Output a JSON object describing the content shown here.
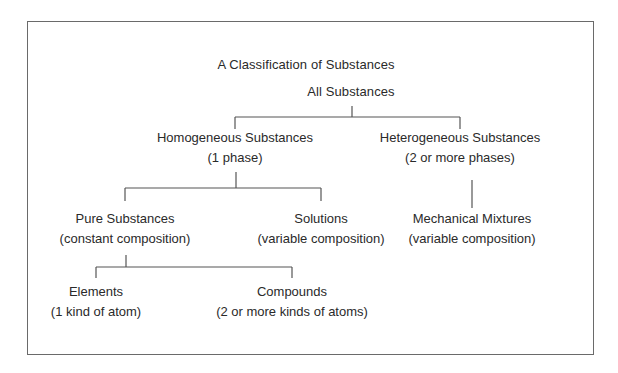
{
  "diagram": {
    "title": "A Classification of Substances",
    "root": {
      "name": "All Substances"
    },
    "nodes": {
      "homogeneous": {
        "name": "Homogeneous Substances",
        "note": "(1 phase)"
      },
      "heterogeneous": {
        "name": "Heterogeneous Substances",
        "note": "(2 or more phases)"
      },
      "pure": {
        "name": "Pure Substances",
        "note": "(constant composition)"
      },
      "solutions": {
        "name": "Solutions",
        "note": "(variable composition)"
      },
      "mechanical": {
        "name": "Mechanical Mixtures",
        "note": "(variable composition)"
      },
      "elements": {
        "name": "Elements",
        "note": "(1 kind of atom)"
      },
      "compounds": {
        "name": "Compounds",
        "note": "(2 or more kinds of atoms)"
      }
    },
    "edges": [
      [
        "root",
        "homogeneous"
      ],
      [
        "root",
        "heterogeneous"
      ],
      [
        "homogeneous",
        "pure"
      ],
      [
        "homogeneous",
        "solutions"
      ],
      [
        "heterogeneous",
        "mechanical"
      ],
      [
        "pure",
        "elements"
      ],
      [
        "pure",
        "compounds"
      ]
    ]
  }
}
